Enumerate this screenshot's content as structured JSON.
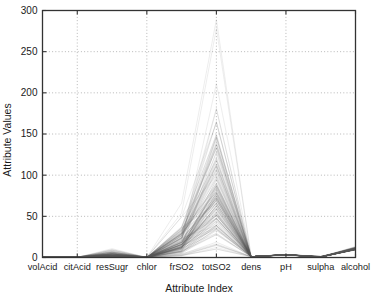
{
  "chart_data": {
    "type": "line",
    "subtype": "parallel-coordinates",
    "title": "",
    "xlabel": "Attribute Index",
    "ylabel": "Attribute Values",
    "categories": [
      "volAcid",
      "citAcid",
      "resSugr",
      "chlor",
      "frSO2",
      "totSO2",
      "dens",
      "pH",
      "sulpha",
      "alcohol"
    ],
    "x_tick_labels": [
      "volAcid",
      "citAcid",
      "resSugr",
      "chlor",
      "frSO2",
      "totSO2",
      "dens",
      "pH",
      "sulpha",
      "alcohol"
    ],
    "y_tick_labels": [
      "0",
      "50",
      "100",
      "150",
      "200",
      "250",
      "300"
    ],
    "y_ticks": [
      0,
      50,
      100,
      150,
      200,
      250,
      300
    ],
    "ylim": [
      0,
      300
    ],
    "xlim": [
      0,
      9
    ],
    "grid": true,
    "grid_style": "dotted",
    "legend": false,
    "legend_position": "none",
    "line_color": "#555555",
    "line_opacity": 0.18,
    "axis_color": "#333333",
    "background": "#ffffff",
    "n_series_drawn": 150,
    "series_summary": [
      {
        "attribute": "volAcid",
        "min": 0.12,
        "max": 1.58,
        "median": 0.52
      },
      {
        "attribute": "citAcid",
        "min": 0.0,
        "max": 1.0,
        "median": 0.26
      },
      {
        "attribute": "resSugr",
        "min": 0.9,
        "max": 15.5,
        "median": 2.2
      },
      {
        "attribute": "chlor",
        "min": 0.01,
        "max": 0.61,
        "median": 0.079
      },
      {
        "attribute": "frSO2",
        "min": 1,
        "max": 72,
        "median": 14
      },
      {
        "attribute": "totSO2",
        "min": 6,
        "max": 289,
        "median": 38
      },
      {
        "attribute": "dens",
        "min": 0.99,
        "max": 1.004,
        "median": 0.9968
      },
      {
        "attribute": "pH",
        "min": 2.74,
        "max": 4.01,
        "median": 3.31
      },
      {
        "attribute": "sulpha",
        "min": 0.33,
        "max": 2.0,
        "median": 0.62
      },
      {
        "attribute": "alcohol",
        "min": 8.4,
        "max": 14.9,
        "median": 10.2
      }
    ],
    "notable_annotations": [
      {
        "text": "outlier line peaks at totSO2",
        "value": 289
      },
      {
        "text": "dense band upper envelope at totSO2",
        "value": 155
      },
      {
        "text": "resSugr bump upper envelope",
        "value": 15.5
      },
      {
        "text": "alcohol upper envelope",
        "value": 14.9
      }
    ]
  }
}
